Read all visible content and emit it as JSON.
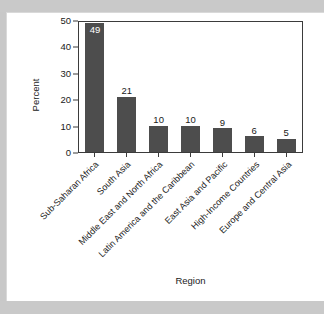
{
  "figure": {
    "background_color": "#c9c9c9",
    "card_color": "#ffffff",
    "x_axis_title": "Region",
    "y_axis_title": "Percent"
  },
  "chart_data": {
    "type": "bar",
    "title": "",
    "xlabel": "Region",
    "ylabel": "Percent",
    "ylim": [
      0,
      50
    ],
    "yticks": [
      0,
      10,
      20,
      30,
      40,
      50
    ],
    "ytick_labels": [
      "0",
      "10",
      "20",
      "30",
      "40",
      "50"
    ],
    "grid": false,
    "legend": null,
    "bar_color": "#4d4d4d",
    "value_label_color_outside": "#1a1a1a",
    "value_label_color_inside": "#ffffff",
    "categories": [
      "Sub-Saharan Africa",
      "South Asia",
      "Middle East and North Africa",
      "Latin America and the Caribbean",
      "East Asia and Pacific",
      "High-Income Countries",
      "Europe and Central Asia"
    ],
    "values": [
      49,
      21,
      10,
      10,
      9,
      6,
      5
    ],
    "value_labels": [
      "49",
      "21",
      "10",
      "10",
      "9",
      "6",
      "5"
    ],
    "label_inside_bar": [
      true,
      false,
      false,
      false,
      false,
      false,
      false
    ]
  }
}
